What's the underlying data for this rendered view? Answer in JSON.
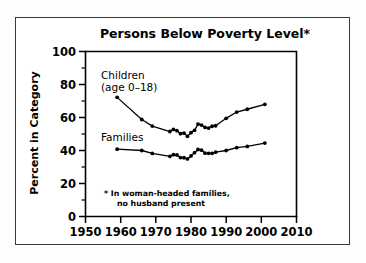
{
  "figure": {
    "title": "Persons Below Poverty Level*",
    "frame_color": "#3a3a3a",
    "background_color": "#ffffff",
    "ink_color": "#000000"
  },
  "annotations": {
    "children_label_line1": "Children",
    "children_label_line2": "(age 0–18)",
    "families_label": "Families",
    "footnote_line1": "* In woman-headed families,",
    "footnote_line2": "no husband present"
  },
  "axes": {
    "y_title": "Percent in Category",
    "y_ticks": [
      "0",
      "20",
      "40",
      "60",
      "80",
      "100"
    ],
    "y_minor_ticks": [
      "10",
      "30",
      "50",
      "70",
      "90"
    ],
    "x_ticks": [
      "1950",
      "1960",
      "1970",
      "1980",
      "1990",
      "2000",
      "2010"
    ]
  },
  "chart_data": {
    "type": "line",
    "title": "Persons Below Poverty Level*",
    "xlabel": "",
    "ylabel": "Percent in Category",
    "xlim": [
      1950,
      2010
    ],
    "ylim": [
      0,
      100
    ],
    "y_major_tick_interval": 20,
    "y_minor_tick_interval": 10,
    "x_major_tick_interval": 10,
    "grid": false,
    "legend": "inline-annotations",
    "footnote": "* In woman-headed families, no husband present",
    "series": [
      {
        "name": "Children (age 0–18)",
        "marker": "filled-circle",
        "x": [
          1959,
          1966,
          1969,
          1974,
          1975,
          1976,
          1977,
          1978,
          1979,
          1980,
          1981,
          1982,
          1983,
          1984,
          1985,
          1986,
          1987,
          1990,
          1993,
          1995,
          1998,
          2001
        ],
        "values": [
          72.2,
          58.8,
          54.8,
          51.5,
          52.7,
          52.0,
          50.3,
          50.6,
          48.6,
          50.8,
          52.3,
          56.0,
          55.4,
          54.0,
          53.6,
          54.7,
          54.7,
          53.4,
          46.1,
          49.3,
          46.1,
          39.3
        ]
      },
      {
        "name": "Families",
        "marker": "filled-circle",
        "x": [
          1959,
          1966,
          1969,
          1974,
          1975,
          1976,
          1977,
          1978,
          1979,
          1980,
          1981,
          1982,
          1983,
          1984,
          1985,
          1986,
          1987,
          1990,
          1993,
          1995,
          1998,
          2001
        ],
        "values": [
          40.8,
          39.8,
          38.2,
          36.5,
          37.5,
          37.3,
          36.2,
          35.6,
          34.9,
          36.7,
          38.7,
          40.6,
          40.2,
          38.4,
          37.6,
          38.3,
          38.1,
          37.2,
          35.6,
          32.4,
          29.9,
          26.4
        ]
      }
    ],
    "series_rendered": [
      {
        "name": "Children (age 0–18)",
        "points": [
          [
            1959,
            72.2
          ],
          [
            1966,
            58.8
          ],
          [
            1969,
            54.8
          ],
          [
            1974,
            51.5
          ],
          [
            1975,
            52.8
          ],
          [
            1976,
            52.0
          ],
          [
            1977,
            50.2
          ],
          [
            1978,
            50.5
          ],
          [
            1979,
            48.6
          ],
          [
            1980,
            50.8
          ],
          [
            1981,
            52.2
          ],
          [
            1982,
            56.0
          ],
          [
            1983,
            55.4
          ],
          [
            1984,
            54.0
          ],
          [
            1985,
            53.6
          ],
          [
            1986,
            54.7
          ],
          [
            1987,
            55.0
          ],
          [
            1990,
            59.5
          ],
          [
            1993,
            63.3
          ],
          [
            1996,
            65.0
          ],
          [
            2001,
            68.0
          ]
        ]
      },
      {
        "name": "Families",
        "points": [
          [
            1959,
            40.8
          ],
          [
            1966,
            40.0
          ],
          [
            1969,
            38.2
          ],
          [
            1974,
            36.5
          ],
          [
            1975,
            37.5
          ],
          [
            1976,
            37.3
          ],
          [
            1977,
            35.7
          ],
          [
            1978,
            35.6
          ],
          [
            1979,
            34.9
          ],
          [
            1980,
            36.7
          ],
          [
            1981,
            38.7
          ],
          [
            1982,
            40.6
          ],
          [
            1983,
            40.2
          ],
          [
            1984,
            38.4
          ],
          [
            1985,
            38.3
          ],
          [
            1986,
            38.3
          ],
          [
            1987,
            39.0
          ],
          [
            1990,
            40.0
          ],
          [
            1993,
            41.7
          ],
          [
            1996,
            42.5
          ],
          [
            2001,
            44.5
          ]
        ]
      }
    ]
  }
}
